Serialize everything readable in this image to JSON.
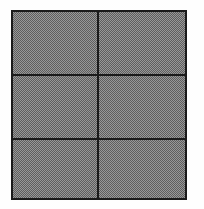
{
  "figure": {
    "title": "Shaded rectangular grid",
    "shape": "rectangle",
    "rows": 3,
    "columns": 2,
    "cell_count": 6,
    "fill_style": "dithered-50-percent-gray",
    "fill_color": "#8c8c8c",
    "line_color": "#1a1a1a",
    "background_color": "#fefefe",
    "border_width_px": 2,
    "rule_width_px": 2,
    "bounds": {
      "left": 11,
      "top": 10,
      "right": 187,
      "bottom": 200,
      "width": 176,
      "height": 190
    },
    "vertical_rules_x": [
      98
    ],
    "horizontal_rules_y": [
      75,
      139
    ]
  },
  "cells": [
    {
      "id": "cell-r1c1",
      "row": 1,
      "column": 1,
      "label": ""
    },
    {
      "id": "cell-r1c2",
      "row": 1,
      "column": 2,
      "label": ""
    },
    {
      "id": "cell-r2c1",
      "row": 2,
      "column": 1,
      "label": ""
    },
    {
      "id": "cell-r2c2",
      "row": 2,
      "column": 2,
      "label": ""
    },
    {
      "id": "cell-r3c1",
      "row": 3,
      "column": 1,
      "label": ""
    },
    {
      "id": "cell-r3c2",
      "row": 3,
      "column": 2,
      "label": ""
    }
  ]
}
